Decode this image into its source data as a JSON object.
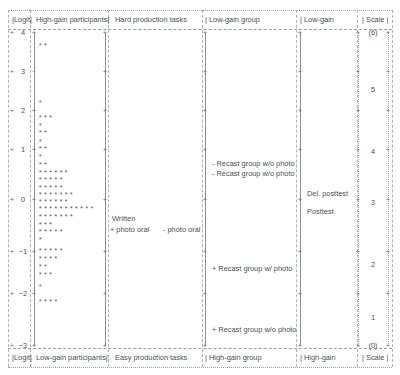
{
  "figure": {
    "type": "wright-map",
    "header": {
      "cells": [
        {
          "label": "|Logit|",
          "x": 12
        },
        {
          "label": "High-gain participants|",
          "x": 36
        },
        {
          "label": "Hard production tasks",
          "x": 115
        },
        {
          "label": "| Low-gain group",
          "x": 205
        },
        {
          "label": "| Low-gain",
          "x": 300
        },
        {
          "label": "| Scale |",
          "x": 362
        }
      ]
    },
    "footer": {
      "cells": [
        {
          "label": "|Logit|",
          "x": 12
        },
        {
          "label": "Low-gain participants|",
          "x": 36
        },
        {
          "label": "Easy production tasks",
          "x": 115
        },
        {
          "label": "| High-gain group",
          "x": 205
        },
        {
          "label": "| High-gain",
          "x": 300
        },
        {
          "label": "| Scale |",
          "x": 362
        }
      ]
    },
    "column_separators_x": [
      8,
      30,
      108,
      202,
      296,
      357,
      392
    ],
    "rails_x": [
      34,
      105,
      205,
      300,
      358,
      388
    ],
    "logit_axis": {
      "label": "Logit",
      "ticks": [
        {
          "value": "4",
          "y": 33
        },
        {
          "value": "3",
          "y": 72
        },
        {
          "value": "2",
          "y": 111
        },
        {
          "value": "1",
          "y": 150
        },
        {
          "value": "0",
          "y": 200
        },
        {
          "value": "−1",
          "y": 252
        },
        {
          "value": "−2",
          "y": 294
        },
        {
          "value": "−3",
          "y": 346
        }
      ]
    },
    "scale_axis": {
      "label": "Scale",
      "ticks": [
        {
          "value": "(6)",
          "y": 33
        },
        {
          "value": "5",
          "y": 90
        },
        {
          "value": "4",
          "y": 152
        },
        {
          "value": "3",
          "y": 203
        },
        {
          "value": "2",
          "y": 265
        },
        {
          "value": "1",
          "y": 318
        },
        {
          "value": "(0)",
          "y": 346
        }
      ]
    },
    "person_rows": [
      {
        "y": 47,
        "stars": "**",
        "accent": false
      },
      {
        "y": 104,
        "stars": "*",
        "accent": false
      },
      {
        "y": 119,
        "stars": "***",
        "accent": false
      },
      {
        "y": 127,
        "stars": "*",
        "accent": true
      },
      {
        "y": 134,
        "stars": "**",
        "accent": false
      },
      {
        "y": 143,
        "stars": "*",
        "accent": false
      },
      {
        "y": 150,
        "stars": "**",
        "accent": false
      },
      {
        "y": 158,
        "stars": "*",
        "accent": false
      },
      {
        "y": 166,
        "stars": "**",
        "accent": false
      },
      {
        "y": 174,
        "stars": "******",
        "accent": false
      },
      {
        "y": 181,
        "stars": "*****",
        "accent": false
      },
      {
        "y": 189,
        "stars": "*****",
        "accent": false
      },
      {
        "y": 196,
        "stars": "*******",
        "accent": false
      },
      {
        "y": 203,
        "stars": "******",
        "accent": false
      },
      {
        "y": 210,
        "stars": "***********",
        "accent": false
      },
      {
        "y": 218,
        "stars": "*******",
        "accent": false
      },
      {
        "y": 226,
        "stars": "***",
        "accent": false
      },
      {
        "y": 233,
        "stars": "*****",
        "accent": false
      },
      {
        "y": 241,
        "stars": "*",
        "accent": false
      },
      {
        "y": 252,
        "stars": "*****",
        "accent": false
      },
      {
        "y": 260,
        "stars": "****",
        "accent": false
      },
      {
        "y": 268,
        "stars": "**",
        "accent": false
      },
      {
        "y": 276,
        "stars": "***",
        "accent": false
      },
      {
        "y": 288,
        "stars": "*",
        "accent": false
      },
      {
        "y": 303,
        "stars": "****",
        "accent": false
      }
    ],
    "item_labels": [
      {
        "text": "- Recast group w/o photo",
        "x": 212,
        "y": 164
      },
      {
        "text": "- Recast group w/o photo",
        "x": 212,
        "y": 174
      },
      {
        "text": "Written",
        "x": 112,
        "y": 219
      },
      {
        "text": "+ photo oral",
        "x": 110,
        "y": 230
      },
      {
        "text": "- photo oral",
        "x": 163,
        "y": 230
      },
      {
        "text": "Del. posttest",
        "x": 307,
        "y": 194
      },
      {
        "text": "Posttest",
        "x": 307,
        "y": 212
      },
      {
        "text": "+ Recast group w/ photo",
        "x": 212,
        "y": 269
      },
      {
        "text": "+ Recast group w/o photo",
        "x": 212,
        "y": 330
      }
    ],
    "tick_rows_y": [
      33,
      72,
      111,
      150,
      200,
      252,
      294,
      346
    ],
    "accent_colors": {
      "text": "#4a4f58",
      "star": "#5b6070",
      "star_accent": "#5a5fa8",
      "rule": "#9aa0aa",
      "rail": "#8b9099",
      "tick_blue": "#6b7fd7",
      "tick_green": "#7fb8b0",
      "tick_red": "#d58f8f"
    }
  }
}
